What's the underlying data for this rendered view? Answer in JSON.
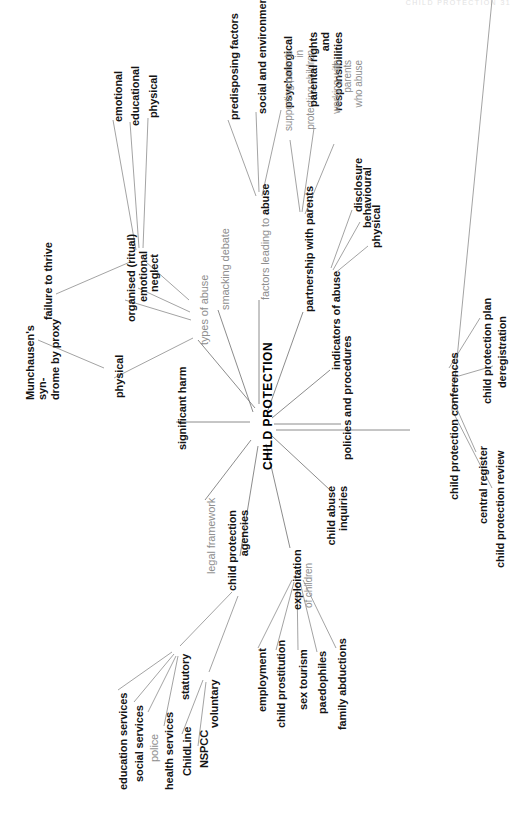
{
  "page": {
    "header_faint": "CHILD PROTECTION   31",
    "title": "CHILD PROTECTION",
    "diagram_type": "mind map",
    "orientation": "rotated 90 degrees (text reads bottom-to-top)"
  },
  "center": {
    "label": "CHILD PROTECTION"
  },
  "branches": [
    {
      "id": "types-of-abuse",
      "label": "types of abuse",
      "style": "grey",
      "children": [
        {
          "label": "physical",
          "style": "bold",
          "children": [
            {
              "label": "Munchausen's syn-\ndrome by proxy",
              "style": "bold"
            }
          ]
        },
        {
          "label": "organised (ritual)",
          "style": "bold"
        },
        {
          "label": "emotional",
          "style": "bold"
        },
        {
          "label": "neglect",
          "style": "bold",
          "children": [
            {
              "label": "emotional",
              "style": "bold"
            },
            {
              "label": "educational",
              "style": "bold"
            },
            {
              "label": "physical",
              "style": "bold"
            },
            {
              "label": "failure to thrive",
              "style": "bold"
            }
          ]
        }
      ]
    },
    {
      "id": "significant-harm",
      "label": "significant harm",
      "style": "bold",
      "children": []
    },
    {
      "id": "smacking-debate",
      "label": "smacking debate",
      "style": "grey",
      "children": []
    },
    {
      "id": "factors-leading-to-abuse",
      "label": "factors leading to abuse",
      "style": "grey-bold-tail",
      "children": [
        {
          "label": "predisposing factors",
          "style": "bold"
        },
        {
          "label": "social and environmental",
          "style": "bold"
        },
        {
          "label": "psychological",
          "style": "bold"
        }
      ]
    },
    {
      "id": "partnership-with-parents",
      "label": "partnership with parents",
      "style": "bold",
      "children": [
        {
          "label": "supporting parents in\nprotecting children",
          "style": "grey"
        },
        {
          "label": "parental rights\nand responsibilities",
          "style": "bold"
        },
        {
          "label": "working with parents\nwho abuse",
          "style": "grey"
        }
      ]
    },
    {
      "id": "indicators-of-abuse",
      "label": "indicators of abuse",
      "style": "bold",
      "children": [
        {
          "label": "disclosure",
          "style": "bold"
        },
        {
          "label": "behavioural",
          "style": "bold"
        },
        {
          "label": "physical",
          "style": "bold"
        }
      ]
    },
    {
      "id": "policies-and-procedures",
      "label": "policies and procedures",
      "style": "bold",
      "children": []
    },
    {
      "id": "child-protection-conferences",
      "label": "child protection conferences",
      "style": "bold",
      "children": [
        {
          "label": "child protection plan",
          "style": "bold"
        },
        {
          "label": "deregistration",
          "style": "bold"
        },
        {
          "label": "central register",
          "style": "bold"
        },
        {
          "label": "child protection review",
          "style": "bold"
        }
      ]
    },
    {
      "id": "child-abuse-inquiries",
      "label": "child abuse\ninquiries",
      "style": "bold",
      "children": []
    },
    {
      "id": "exploitation-of-children",
      "label": "exploitation",
      "sublabel": "of children",
      "style": "bold",
      "children": [
        {
          "label": "employment",
          "style": "bold"
        },
        {
          "label": "child prostitution",
          "style": "bold"
        },
        {
          "label": "sex tourism",
          "style": "bold"
        },
        {
          "label": "paedophiles",
          "style": "bold"
        },
        {
          "label": "family abductions",
          "style": "bold"
        }
      ]
    },
    {
      "id": "child-protection-agencies",
      "label": "child protection\nagencies",
      "style": "bold",
      "children": [
        {
          "label": "statutory",
          "style": "bold",
          "children": [
            {
              "label": "education services",
              "style": "bold"
            },
            {
              "label": "social services",
              "style": "bold"
            },
            {
              "label": "police",
              "style": "grey"
            },
            {
              "label": "health services",
              "style": "bold"
            }
          ]
        },
        {
          "label": "voluntary",
          "style": "bold",
          "children": [
            {
              "label": "ChildLine",
              "style": "bold"
            },
            {
              "label": "NSPCC",
              "style": "bold"
            }
          ]
        }
      ]
    },
    {
      "id": "legal-framework",
      "label": "legal framework",
      "style": "grey",
      "children": []
    }
  ],
  "labels": {
    "types_of_abuse": "types of abuse",
    "physical_1": "physical",
    "munchausen": "Munchausen's syn-\ndrome by proxy",
    "organised_ritual": "organised (ritual)",
    "emotional_1": "emotional",
    "neglect": "neglect",
    "emotional_2": "emotional",
    "educational": "educational",
    "physical_2": "physical",
    "failure_to_thrive": "failure to thrive",
    "significant_harm": "significant harm",
    "smacking_debate": "smacking debate",
    "factors_leading": "factors leading to ",
    "factors_leading_bold": "abuse",
    "predisposing_factors": "predisposing factors",
    "social_environmental": "social and environmental",
    "psychological": "psychological",
    "partnership_with_parents": "partnership with parents",
    "supporting_parents": "supporting parents in\nprotecting children",
    "parental_rights": "parental rights\nand responsibilities",
    "working_with_parents": "working with parents\nwho abuse",
    "indicators_of_abuse": "indicators of abuse",
    "disclosure": "disclosure",
    "behavioural": "behavioural",
    "physical_3": "physical",
    "policies_procedures": "policies and procedures",
    "cp_conferences": "child protection conferences",
    "cp_plan": "child protection plan",
    "deregistration": "deregistration",
    "central_register": "central register",
    "cp_review": "child protection review",
    "child_abuse_inquiries": "child abuse\ninquiries",
    "exploitation": "exploitation",
    "of_children": "of children",
    "employment": "employment",
    "child_prostitution": "child prostitution",
    "sex_tourism": "sex tourism",
    "paedophiles": "paedophiles",
    "family_abductions": "family abductions",
    "cp_agencies": "child protection\nagencies",
    "statutory": "statutory",
    "voluntary": "voluntary",
    "education_services": "education services",
    "social_services": "social services",
    "police": "police",
    "health_services": "health services",
    "childline": "ChildLine",
    "nspcc": "NSPCC",
    "legal_framework": "legal framework"
  }
}
